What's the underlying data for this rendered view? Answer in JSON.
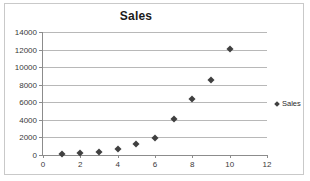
{
  "chart_data": {
    "type": "scatter",
    "title": "Sales",
    "xlabel": "",
    "ylabel": "",
    "xlim": [
      0,
      12
    ],
    "ylim": [
      0,
      14000
    ],
    "xticks": [
      0,
      2,
      4,
      6,
      8,
      10,
      12
    ],
    "ytick_labels": [
      "0",
      "2000",
      "4000",
      "6000",
      "8000",
      "10000",
      "12000",
      "14000"
    ],
    "yticks": [
      0,
      2000,
      4000,
      6000,
      8000,
      10000,
      12000,
      14000
    ],
    "grid": true,
    "legend_position": "right",
    "series": [
      {
        "name": "Sales",
        "marker": "diamond",
        "color": "#404040",
        "x": [
          1,
          2,
          3,
          4,
          5,
          6,
          7,
          8,
          9,
          10
        ],
        "values": [
          100,
          200,
          350,
          650,
          1200,
          1900,
          4100,
          6400,
          8500,
          12100
        ]
      }
    ]
  },
  "legend": {
    "entries": [
      {
        "label": "Sales",
        "marker_icon": "diamond-marker-icon"
      }
    ]
  }
}
